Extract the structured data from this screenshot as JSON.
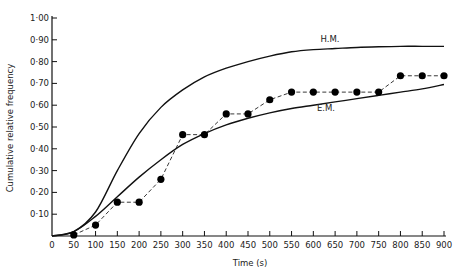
{
  "chart_data": {
    "type": "line",
    "title": "",
    "xlabel": "Time (s)",
    "ylabel": "Cumulative relative frequency",
    "xlim": [
      0,
      900
    ],
    "ylim": [
      0,
      1.0
    ],
    "grid": false,
    "legend": "none (curves labelled directly)",
    "x_ticks": [
      "0",
      "50",
      "100",
      "150",
      "200",
      "250",
      "300",
      "350",
      "400",
      "450",
      "500",
      "550",
      "600",
      "650",
      "700",
      "750",
      "800",
      "850",
      "900"
    ],
    "y_ticks": [
      "0·10",
      "0·20",
      "0·30",
      "0·40",
      "0·50",
      "0·60",
      "0·70",
      "0·80",
      "0·90",
      "1·00"
    ],
    "series": [
      {
        "name": "H.M.",
        "style": "solid line",
        "x": [
          0,
          50,
          100,
          150,
          200,
          250,
          300,
          350,
          400,
          450,
          500,
          550,
          600,
          650,
          700,
          750,
          800,
          850,
          900
        ],
        "values": [
          0.0,
          0.02,
          0.11,
          0.3,
          0.47,
          0.59,
          0.67,
          0.73,
          0.77,
          0.8,
          0.825,
          0.845,
          0.855,
          0.86,
          0.865,
          0.868,
          0.87,
          0.87,
          0.87
        ]
      },
      {
        "name": "E.M.",
        "style": "solid line",
        "x": [
          0,
          50,
          100,
          150,
          200,
          250,
          300,
          350,
          400,
          450,
          500,
          550,
          600,
          650,
          700,
          750,
          800,
          850,
          900
        ],
        "values": [
          0.0,
          0.02,
          0.09,
          0.18,
          0.27,
          0.35,
          0.42,
          0.47,
          0.51,
          0.54,
          0.565,
          0.585,
          0.6,
          0.615,
          0.63,
          0.645,
          0.66,
          0.675,
          0.695
        ]
      },
      {
        "name": "Observed",
        "style": "dashed line with filled circle markers",
        "x": [
          50,
          100,
          150,
          200,
          250,
          300,
          350,
          400,
          450,
          500,
          550,
          600,
          650,
          700,
          750,
          800,
          850,
          900
        ],
        "values": [
          0.005,
          0.05,
          0.155,
          0.155,
          0.26,
          0.465,
          0.465,
          0.56,
          0.56,
          0.625,
          0.66,
          0.66,
          0.66,
          0.66,
          0.66,
          0.735,
          0.735,
          0.735
        ]
      }
    ],
    "annotations": [
      {
        "text": "H.M.",
        "x": 650,
        "y": 0.88
      },
      {
        "text": "E.M.",
        "x": 640,
        "y": 0.56
      }
    ]
  },
  "labels": {
    "xlabel": "Time (s)",
    "ylabel": "Cumulative relative frequency",
    "hm": "H.M.",
    "em": "E.M."
  }
}
